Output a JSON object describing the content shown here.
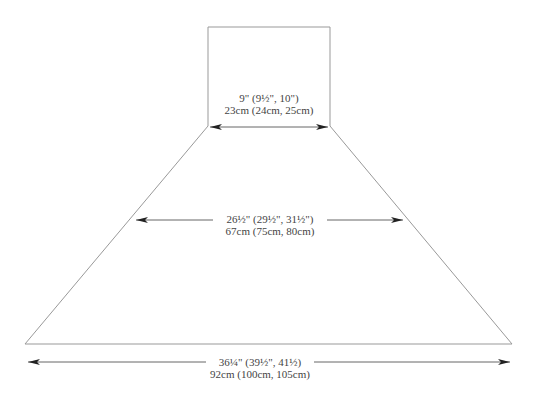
{
  "diagram": {
    "type": "schematic",
    "shape": "shawl / cape schematic: neck rectangle atop trapezoid",
    "line_color": "#888888",
    "arrow_color": "#222222",
    "text_color": "#444444",
    "measurements": {
      "neck": {
        "imperial": "9\" (9½\", 10\")",
        "metric": "23cm (24cm, 25cm)"
      },
      "middle": {
        "imperial": "26½\" (29½\", 31½\")",
        "metric": "67cm (75cm, 80cm)"
      },
      "bottom": {
        "imperial": "36¼\" (39½\", 41½)",
        "metric": "92cm (100cm, 105cm)"
      }
    }
  }
}
